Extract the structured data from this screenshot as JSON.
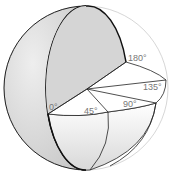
{
  "diagram": {
    "type": "sphere-angular-sections",
    "colors": {
      "sphere_fill": "#d9d9d9",
      "cut_face_fill": "#ffffff",
      "outline": "#222222",
      "label": "#777777"
    },
    "labels": [
      {
        "id": "deg-0",
        "text": "0°"
      },
      {
        "id": "deg-45",
        "text": "45°"
      },
      {
        "id": "deg-90",
        "text": "90°"
      },
      {
        "id": "deg-135",
        "text": "135°"
      },
      {
        "id": "deg-180",
        "text": "180°"
      }
    ]
  }
}
